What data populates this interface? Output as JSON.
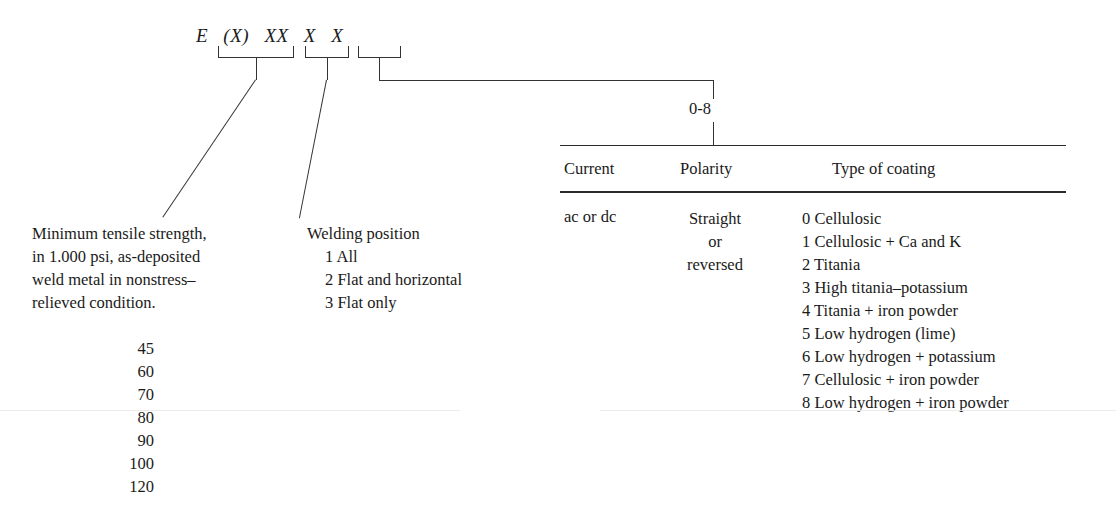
{
  "code_notation": {
    "tokens": [
      "E",
      "(X)",
      "XX",
      "X",
      "X"
    ]
  },
  "range_label": "0-8",
  "tensile": {
    "description_line1": "Minimum tensile strength,",
    "description_line2": "in 1.000 psi, as-deposited",
    "description_line3": "weld metal in nonstress–",
    "description_line4": "relieved condition.",
    "values": [
      "45",
      "60",
      "70",
      "80",
      "90",
      "100",
      "120"
    ]
  },
  "welding_position": {
    "title": "Welding position",
    "items": [
      "1 All",
      "2 Flat and horizontal",
      "3 Flat only"
    ]
  },
  "coating_table": {
    "headers": [
      "Current",
      "Polarity",
      "Type of coating"
    ],
    "current_value": "ac or dc",
    "polarity_value": "Straight\nor\nreversed",
    "polarity_lines": [
      "Straight",
      "or",
      "reversed"
    ],
    "coating_types": [
      "0 Cellulosic",
      "1 Cellulosic + Ca and K",
      "2 Titania",
      "3 High titania–potassium",
      "4 Titania + iron powder",
      "5 Low hydrogen (lime)",
      "6 Low hydrogen + potassium",
      "7 Cellulosic + iron powder",
      "8 Low hydrogen + iron powder"
    ]
  },
  "colors": {
    "ink": "#1a1a1a",
    "line": "#333333",
    "rule": "#2b2b2b",
    "background": "#ffffff"
  }
}
